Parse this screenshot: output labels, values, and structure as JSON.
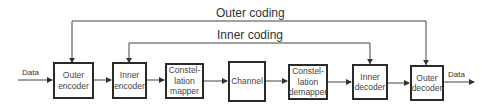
{
  "diagram": {
    "loops": {
      "outer": "Outer coding",
      "inner": "Inner coding"
    },
    "input_label": "Data",
    "output_label": "Data",
    "blocks": [
      {
        "id": "outer-encoder",
        "lines": [
          "Outer",
          "encoder"
        ]
      },
      {
        "id": "inner-encoder",
        "lines": [
          "Inner",
          "encoder"
        ]
      },
      {
        "id": "constellation-mapper",
        "lines": [
          "Constel-",
          "lation",
          "mapper"
        ]
      },
      {
        "id": "channel",
        "lines": [
          "Channel"
        ]
      },
      {
        "id": "constellation-demapper",
        "lines": [
          "Constel-",
          "lation",
          "demapper"
        ]
      },
      {
        "id": "inner-decoder",
        "lines": [
          "Inner",
          "decoder"
        ]
      },
      {
        "id": "outer-decoder",
        "lines": [
          "Outer",
          "decoder"
        ]
      }
    ]
  }
}
